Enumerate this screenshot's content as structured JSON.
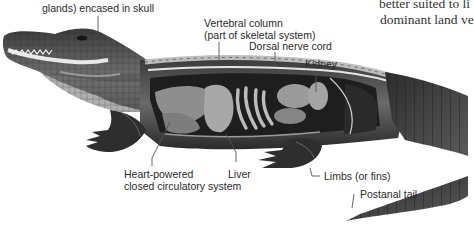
{
  "figure": {
    "labels": {
      "brain": "glands) encased in skull",
      "vertebral_line1": "Vertebral column",
      "vertebral_line2": "(part of skeletal system)",
      "nerve": "Dorsal nerve cord",
      "kidney": "Kidney",
      "heart_line1": "Heart-powered",
      "heart_line2": "closed circulatory system",
      "liver": "Liver",
      "limbs": "Limbs (or fins)",
      "tail": "Postanal tail"
    }
  },
  "body_text": {
    "line1": "better suited to li",
    "line2": "dominant land ve"
  },
  "colors": {
    "background": "#ffffff",
    "label_text": "#2a2a2a",
    "leader_line": "#555555",
    "body_text": "#333333"
  }
}
